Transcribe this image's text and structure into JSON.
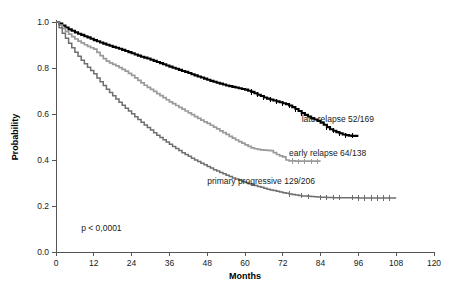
{
  "chart_data": {
    "type": "line",
    "title": "",
    "xlabel": "Months",
    "ylabel": "Probability",
    "xlim": [
      0,
      120
    ],
    "ylim": [
      0.0,
      1.0
    ],
    "xticks": [
      0,
      12,
      24,
      36,
      48,
      60,
      72,
      84,
      96,
      108,
      120
    ],
    "xtick_labels": [
      "0",
      "12",
      "24",
      "36",
      "48",
      "60",
      "72",
      "84",
      "96",
      "108",
      "120"
    ],
    "yticks": [
      0.0,
      0.2,
      0.4,
      0.6,
      0.8,
      1.0
    ],
    "ytick_labels": [
      "0.0",
      "0.2",
      "0.4",
      "0.6",
      "0.8",
      "1.0"
    ],
    "grid": false,
    "legend_position": "inline-right-of-curves",
    "annotations": [
      {
        "name": "p-value",
        "text": "p < 0,0001",
        "x": 8,
        "y": 0.09
      }
    ],
    "series": [
      {
        "name": "late relapse",
        "label": "late relapse 52/169",
        "events": 52,
        "total": 169,
        "color": "#000000",
        "width": 2.1,
        "label_x": 78,
        "label_y": 0.565,
        "final_probability": 0.505,
        "points": [
          [
            0,
            1.0
          ],
          [
            1,
            0.993
          ],
          [
            2,
            0.985
          ],
          [
            3,
            0.976
          ],
          [
            4,
            0.968
          ],
          [
            5,
            0.962
          ],
          [
            6,
            0.955
          ],
          [
            7,
            0.949
          ],
          [
            8,
            0.944
          ],
          [
            9,
            0.938
          ],
          [
            10,
            0.933
          ],
          [
            11,
            0.927
          ],
          [
            12,
            0.921
          ],
          [
            13,
            0.916
          ],
          [
            14,
            0.911
          ],
          [
            15,
            0.906
          ],
          [
            16,
            0.901
          ],
          [
            17,
            0.897
          ],
          [
            18,
            0.892
          ],
          [
            19,
            0.888
          ],
          [
            20,
            0.884
          ],
          [
            21,
            0.879
          ],
          [
            22,
            0.874
          ],
          [
            23,
            0.869
          ],
          [
            24,
            0.864
          ],
          [
            25,
            0.859
          ],
          [
            26,
            0.854
          ],
          [
            27,
            0.849
          ],
          [
            28,
            0.845
          ],
          [
            29,
            0.841
          ],
          [
            30,
            0.836
          ],
          [
            31,
            0.831
          ],
          [
            32,
            0.826
          ],
          [
            33,
            0.821
          ],
          [
            34,
            0.816
          ],
          [
            35,
            0.811
          ],
          [
            36,
            0.806
          ],
          [
            37,
            0.801
          ],
          [
            38,
            0.797
          ],
          [
            39,
            0.792
          ],
          [
            40,
            0.787
          ],
          [
            41,
            0.783
          ],
          [
            42,
            0.778
          ],
          [
            43,
            0.773
          ],
          [
            44,
            0.768
          ],
          [
            45,
            0.763
          ],
          [
            46,
            0.759
          ],
          [
            47,
            0.754
          ],
          [
            48,
            0.749
          ],
          [
            49,
            0.744
          ],
          [
            50,
            0.74
          ],
          [
            51,
            0.736
          ],
          [
            52,
            0.732
          ],
          [
            53,
            0.728
          ],
          [
            54,
            0.724
          ],
          [
            55,
            0.721
          ],
          [
            56,
            0.718
          ],
          [
            57,
            0.715
          ],
          [
            58,
            0.712
          ],
          [
            59,
            0.709
          ],
          [
            60,
            0.706
          ],
          [
            61,
            0.701
          ],
          [
            62,
            0.696
          ],
          [
            63,
            0.69
          ],
          [
            64,
            0.684
          ],
          [
            65,
            0.678
          ],
          [
            66,
            0.672
          ],
          [
            67,
            0.667
          ],
          [
            68,
            0.663
          ],
          [
            69,
            0.659
          ],
          [
            70,
            0.655
          ],
          [
            71,
            0.651
          ],
          [
            72,
            0.647
          ],
          [
            73,
            0.643
          ],
          [
            74,
            0.637
          ],
          [
            75,
            0.63
          ],
          [
            76,
            0.622
          ],
          [
            77,
            0.613
          ],
          [
            78,
            0.604
          ],
          [
            79,
            0.596
          ],
          [
            80,
            0.589
          ],
          [
            81,
            0.582
          ],
          [
            82,
            0.576
          ],
          [
            83,
            0.57
          ],
          [
            84,
            0.562
          ],
          [
            85,
            0.553
          ],
          [
            86,
            0.543
          ],
          [
            87,
            0.534
          ],
          [
            88,
            0.527
          ],
          [
            89,
            0.521
          ],
          [
            90,
            0.516
          ],
          [
            91,
            0.511
          ],
          [
            92,
            0.508
          ],
          [
            93,
            0.506
          ],
          [
            94,
            0.505
          ],
          [
            96,
            0.505
          ]
        ],
        "censor_times": [
          62,
          64,
          66,
          68,
          70,
          72,
          74,
          76,
          78,
          86,
          88,
          90,
          92,
          94
        ]
      },
      {
        "name": "early relapse",
        "label": "early relapse 64/138",
        "events": 64,
        "total": 138,
        "color": "#9a9a9a",
        "width": 1.7,
        "label_x": 74,
        "label_y": 0.418,
        "final_probability": 0.395,
        "points": [
          [
            0,
            1.0
          ],
          [
            1,
            0.986
          ],
          [
            2,
            0.972
          ],
          [
            3,
            0.959
          ],
          [
            4,
            0.947
          ],
          [
            5,
            0.936
          ],
          [
            6,
            0.926
          ],
          [
            7,
            0.917
          ],
          [
            8,
            0.909
          ],
          [
            9,
            0.901
          ],
          [
            10,
            0.894
          ],
          [
            11,
            0.888
          ],
          [
            12,
            0.882
          ],
          [
            13,
            0.868
          ],
          [
            14,
            0.854
          ],
          [
            15,
            0.841
          ],
          [
            16,
            0.83
          ],
          [
            17,
            0.822
          ],
          [
            18,
            0.816
          ],
          [
            19,
            0.809
          ],
          [
            20,
            0.802
          ],
          [
            21,
            0.794
          ],
          [
            22,
            0.786
          ],
          [
            23,
            0.777
          ],
          [
            24,
            0.768
          ],
          [
            25,
            0.757
          ],
          [
            26,
            0.746
          ],
          [
            27,
            0.735
          ],
          [
            28,
            0.725
          ],
          [
            29,
            0.716
          ],
          [
            30,
            0.707
          ],
          [
            31,
            0.698
          ],
          [
            32,
            0.689
          ],
          [
            33,
            0.68
          ],
          [
            34,
            0.671
          ],
          [
            35,
            0.662
          ],
          [
            36,
            0.653
          ],
          [
            37,
            0.645
          ],
          [
            38,
            0.637
          ],
          [
            39,
            0.629
          ],
          [
            40,
            0.621
          ],
          [
            41,
            0.613
          ],
          [
            42,
            0.605
          ],
          [
            43,
            0.597
          ],
          [
            44,
            0.589
          ],
          [
            45,
            0.581
          ],
          [
            46,
            0.573
          ],
          [
            47,
            0.566
          ],
          [
            48,
            0.559
          ],
          [
            49,
            0.551
          ],
          [
            50,
            0.543
          ],
          [
            51,
            0.535
          ],
          [
            52,
            0.527
          ],
          [
            53,
            0.519
          ],
          [
            54,
            0.511
          ],
          [
            55,
            0.503
          ],
          [
            56,
            0.495
          ],
          [
            57,
            0.487
          ],
          [
            58,
            0.48
          ],
          [
            59,
            0.473
          ],
          [
            60,
            0.466
          ],
          [
            61,
            0.459
          ],
          [
            62,
            0.453
          ],
          [
            63,
            0.449
          ],
          [
            64,
            0.446
          ],
          [
            65,
            0.444
          ],
          [
            66,
            0.443
          ],
          [
            67,
            0.442
          ],
          [
            68,
            0.441
          ],
          [
            69,
            0.432
          ],
          [
            70,
            0.424
          ],
          [
            71,
            0.418
          ],
          [
            72,
            0.414
          ],
          [
            73,
            0.4
          ],
          [
            74,
            0.396
          ],
          [
            76,
            0.395
          ],
          [
            84,
            0.395
          ]
        ],
        "censor_times": [
          75,
          77,
          79,
          81,
          83
        ]
      },
      {
        "name": "primary progressive",
        "label": "primary progressive 129/206",
        "events": 129,
        "total": 206,
        "color": "#6e6e6e",
        "width": 1.5,
        "label_x": 48,
        "label_y": 0.295,
        "final_probability": 0.235,
        "points": [
          [
            0,
            1.0
          ],
          [
            1,
            0.975
          ],
          [
            2,
            0.951
          ],
          [
            3,
            0.929
          ],
          [
            4,
            0.908
          ],
          [
            5,
            0.888
          ],
          [
            6,
            0.869
          ],
          [
            7,
            0.851
          ],
          [
            8,
            0.834
          ],
          [
            9,
            0.818
          ],
          [
            10,
            0.803
          ],
          [
            11,
            0.789
          ],
          [
            12,
            0.775
          ],
          [
            13,
            0.757
          ],
          [
            14,
            0.74
          ],
          [
            15,
            0.724
          ],
          [
            16,
            0.708
          ],
          [
            17,
            0.693
          ],
          [
            18,
            0.679
          ],
          [
            19,
            0.665
          ],
          [
            20,
            0.651
          ],
          [
            21,
            0.638
          ],
          [
            22,
            0.625
          ],
          [
            23,
            0.613
          ],
          [
            24,
            0.601
          ],
          [
            25,
            0.588
          ],
          [
            26,
            0.576
          ],
          [
            27,
            0.564
          ],
          [
            28,
            0.552
          ],
          [
            29,
            0.541
          ],
          [
            30,
            0.53
          ],
          [
            31,
            0.519
          ],
          [
            32,
            0.508
          ],
          [
            33,
            0.498
          ],
          [
            34,
            0.488
          ],
          [
            35,
            0.478
          ],
          [
            36,
            0.468
          ],
          [
            37,
            0.459
          ],
          [
            38,
            0.45
          ],
          [
            39,
            0.441
          ],
          [
            40,
            0.432
          ],
          [
            41,
            0.424
          ],
          [
            42,
            0.416
          ],
          [
            43,
            0.408
          ],
          [
            44,
            0.4
          ],
          [
            45,
            0.393
          ],
          [
            46,
            0.386
          ],
          [
            47,
            0.379
          ],
          [
            48,
            0.372
          ],
          [
            49,
            0.365
          ],
          [
            50,
            0.358
          ],
          [
            51,
            0.352
          ],
          [
            52,
            0.346
          ],
          [
            53,
            0.34
          ],
          [
            54,
            0.334
          ],
          [
            55,
            0.328
          ],
          [
            56,
            0.322
          ],
          [
            57,
            0.317
          ],
          [
            58,
            0.312
          ],
          [
            59,
            0.307
          ],
          [
            60,
            0.302
          ],
          [
            61,
            0.297
          ],
          [
            62,
            0.293
          ],
          [
            63,
            0.289
          ],
          [
            64,
            0.285
          ],
          [
            65,
            0.281
          ],
          [
            66,
            0.277
          ],
          [
            67,
            0.273
          ],
          [
            68,
            0.27
          ],
          [
            69,
            0.267
          ],
          [
            70,
            0.264
          ],
          [
            71,
            0.261
          ],
          [
            72,
            0.258
          ],
          [
            73,
            0.255
          ],
          [
            74,
            0.252
          ],
          [
            75,
            0.25
          ],
          [
            76,
            0.248
          ],
          [
            77,
            0.246
          ],
          [
            78,
            0.244
          ],
          [
            79,
            0.243
          ],
          [
            80,
            0.242
          ],
          [
            81,
            0.241
          ],
          [
            82,
            0.24
          ],
          [
            83,
            0.239
          ],
          [
            84,
            0.238
          ],
          [
            86,
            0.237
          ],
          [
            88,
            0.236
          ],
          [
            92,
            0.236
          ],
          [
            96,
            0.235
          ],
          [
            108,
            0.235
          ]
        ],
        "censor_times": [
          74,
          78,
          80,
          84,
          86,
          88,
          90,
          94,
          96,
          98,
          100,
          102,
          104,
          106
        ]
      }
    ]
  }
}
